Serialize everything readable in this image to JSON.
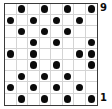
{
  "figure": {
    "kind": "dot-grid-diagram",
    "columns": 8,
    "rows": 9,
    "dot_color": "#0b0b0b",
    "grid_line_color": "#d4d4d4",
    "border_color": "#3a3a3a",
    "background_color": "#ffffff"
  },
  "labels": {
    "top_right": "9",
    "bottom_right": "1"
  },
  "chart_data": {
    "type": "heatmap",
    "title": "",
    "xlabel": "",
    "ylabel": "",
    "grid": true,
    "legend": "none",
    "columns": 8,
    "rows": 9,
    "row_labels": [
      "9",
      "",
      "",
      "",
      "",
      "",
      "",
      "",
      "1"
    ],
    "column_labels": [
      "1",
      "2",
      "3",
      "4",
      "5",
      "6",
      "7",
      "8"
    ],
    "annotations": [
      {
        "text": "9",
        "position": "top-right"
      },
      {
        "text": "1",
        "position": "bottom-right"
      }
    ],
    "values": [
      [
        0,
        1,
        0,
        1,
        0,
        1,
        0,
        1
      ],
      [
        1,
        0,
        1,
        0,
        1,
        0,
        1,
        0
      ],
      [
        0,
        1,
        0,
        1,
        0,
        1,
        0,
        0
      ],
      [
        0,
        0,
        1,
        0,
        1,
        0,
        0,
        1
      ],
      [
        1,
        0,
        1,
        0,
        0,
        0,
        1,
        1
      ],
      [
        0,
        0,
        1,
        0,
        1,
        0,
        0,
        1
      ],
      [
        0,
        1,
        0,
        1,
        0,
        1,
        0,
        0
      ],
      [
        1,
        0,
        1,
        0,
        1,
        0,
        1,
        0
      ],
      [
        0,
        1,
        0,
        1,
        0,
        1,
        0,
        1
      ]
    ]
  }
}
